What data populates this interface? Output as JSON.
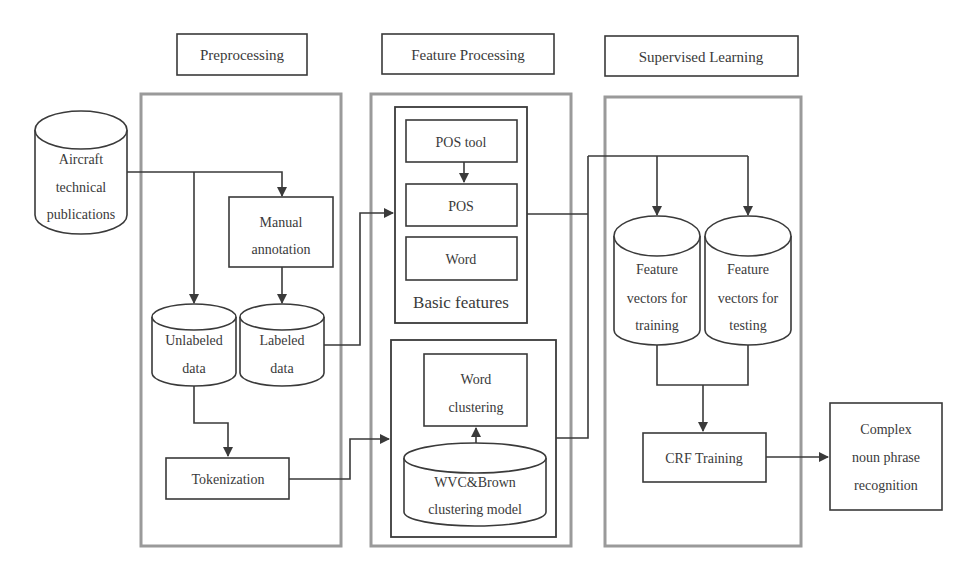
{
  "sections": {
    "preprocessing": "Preprocessing",
    "feature_processing": "Feature Processing",
    "supervised_learning": "Supervised Learning"
  },
  "nodes": {
    "aircraft_pubs": [
      "Aircraft",
      "technical",
      "publications"
    ],
    "manual_annotation": [
      "Manual",
      "annotation"
    ],
    "unlabeled_data": [
      "Unlabeled",
      "data"
    ],
    "labeled_data": [
      "Labeled",
      "data"
    ],
    "tokenization": "Tokenization",
    "pos_tool": "POS tool",
    "pos": "POS",
    "word": "Word",
    "basic_features": "Basic features",
    "word_clustering": [
      "Word",
      "clustering"
    ],
    "wvc_brown_model": [
      "WVC&Brown",
      "clustering model"
    ],
    "fv_training": [
      "Feature",
      "vectors for",
      "training"
    ],
    "fv_testing": [
      "Feature",
      "vectors for",
      "testing"
    ],
    "crf_training": "CRF Training",
    "complex_np": [
      "Complex",
      "noun phrase",
      "recognition"
    ]
  },
  "colors": {
    "line": "#3a3a3a",
    "panel_border": "#9a9a9a",
    "background": "#ffffff"
  }
}
